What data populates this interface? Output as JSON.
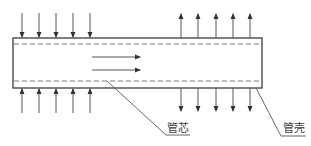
{
  "diagram": {
    "labels": {
      "core": "管芯",
      "shell": "管壳"
    },
    "colors": {
      "stroke": "#3c3c3c",
      "dashed": "#7a7a7a",
      "arrow": "#555555",
      "background": "#ffffff"
    },
    "tube": {
      "left": 13,
      "top": 38,
      "right": 262,
      "bottom": 88
    },
    "dashed_lines_y": [
      44,
      81
    ],
    "inflow_arrows_x": [
      22,
      39,
      56,
      73,
      90
    ],
    "outflow_arrows_x": [
      181,
      198,
      216,
      233,
      250
    ],
    "axial_flow_arrows": [
      {
        "x1": 92,
        "x2": 140,
        "y": 57
      },
      {
        "x1": 92,
        "x2": 140,
        "y": 70
      }
    ]
  }
}
